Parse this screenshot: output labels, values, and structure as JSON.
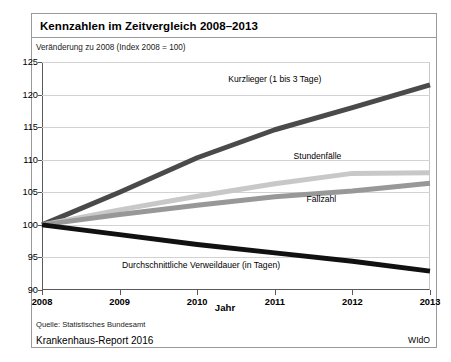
{
  "header": {
    "title": "Kennzahlen im Zeitvergleich 2008–2013"
  },
  "footer": {
    "source": "Quelle: Statistisches Bundesamt",
    "report": "Krankenhaus-Report 2016",
    "publisher": "WIdO"
  },
  "chart_data": {
    "type": "line",
    "title": "Kennzahlen im Zeitvergleich 2008–2013",
    "subtitle": "Veränderung zu 2008 (Index 2008 = 100)",
    "xlabel": "Jahr",
    "ylabel": "",
    "x": [
      2008,
      2009,
      2010,
      2011,
      2012,
      2013
    ],
    "categories": [
      "2008",
      "2009",
      "2010",
      "2011",
      "2012",
      "2013"
    ],
    "xlim": [
      2008,
      2013
    ],
    "ylim": [
      90,
      125
    ],
    "yticks": [
      90,
      95,
      100,
      105,
      110,
      115,
      120,
      125
    ],
    "ytick_labels": [
      "90",
      "95",
      "100",
      "105",
      "110",
      "115",
      "120",
      "125"
    ],
    "grid": true,
    "legend": "inline-annotations",
    "series": [
      {
        "name": "Kurzlieger (1 bis 3 Tage)",
        "color": "#4a4a4a",
        "values": [
          100.0,
          105.0,
          110.3,
          114.6,
          118.0,
          121.5
        ],
        "label_x": 2011.0,
        "label_y": 122.4
      },
      {
        "name": "Stundenfälle",
        "color": "#c8c8c8",
        "values": [
          100.0,
          102.3,
          104.4,
          106.3,
          107.9,
          108.0
        ],
        "label_x": 2011.55,
        "label_y": 110.6
      },
      {
        "name": "Fallzahl",
        "color": "#989898",
        "values": [
          100.0,
          101.6,
          103.0,
          104.3,
          105.2,
          106.4
        ],
        "label_x": 2011.6,
        "label_y": 104.0
      },
      {
        "name": "Durchschnittliche Verweildauer (in Tagen)",
        "color": "#111111",
        "values": [
          100.0,
          98.5,
          97.0,
          95.7,
          94.4,
          92.9
        ],
        "label_x": 2010.05,
        "label_y": 93.9
      }
    ]
  }
}
